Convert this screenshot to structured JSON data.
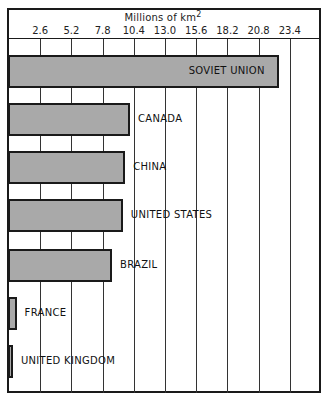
{
  "chart_data": {
    "type": "bar",
    "orientation": "horizontal",
    "title": "",
    "xlabel": "Millions of km",
    "xlabel_superscript": "2",
    "ylabel": "",
    "xlim": [
      0,
      26
    ],
    "x_ticks": [
      "2.6",
      "5.2",
      "7.8",
      "10.4",
      "13.0",
      "15.6",
      "18.2",
      "20.8",
      "23.4"
    ],
    "grid": true,
    "legend": "none",
    "categories": [
      "SOVIET UNION",
      "CANADA",
      "CHINA",
      "UNITED STATES",
      "BRAZIL",
      "FRANCE",
      "UNITED KINGDOM"
    ],
    "values": [
      22.4,
      10.0,
      9.6,
      9.4,
      8.5,
      0.55,
      0.24
    ],
    "bar_color": "#a9a9a9"
  },
  "axis": {
    "title": "Millions of km",
    "title_sup": "2"
  }
}
